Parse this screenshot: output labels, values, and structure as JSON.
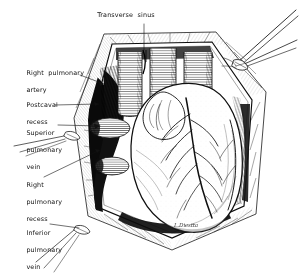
{
  "figure": {
    "medium": "pen-and-ink line drawing",
    "background_color": "#ffffff",
    "ink_color": "#111111",
    "signature": "L.Diestta"
  },
  "labels": [
    {
      "id": "transverse-sinus",
      "text": "Transverse  sinus",
      "lines": [
        "Transverse  sinus"
      ],
      "x": 126,
      "y": 14,
      "anchor": "center",
      "leader_from": [
        144,
        24
      ],
      "leader_to": [
        144,
        50
      ]
    },
    {
      "id": "right-pulmonary-artery",
      "text": "Right pulmonary artery",
      "lines": [
        "Right  pulmonary",
        "artery"
      ],
      "x": 22,
      "y": 60,
      "anchor": "left",
      "leader_from": [
        80,
        75
      ],
      "leader_to": [
        104,
        84
      ]
    },
    {
      "id": "postcaval-recess",
      "text": "Postcaval recess",
      "lines": [
        "Postcaval",
        "recess"
      ],
      "x": 22,
      "y": 92,
      "anchor": "left",
      "leader_from": [
        55,
        105
      ],
      "leader_to": [
        99,
        104
      ]
    },
    {
      "id": "superior-pulmonary-vein",
      "text": "Superior pulmonary vein",
      "lines": [
        "Superior",
        "pulmonary",
        "vein"
      ],
      "x": 22,
      "y": 120,
      "anchor": "left",
      "leader_from": [
        58,
        125
      ],
      "leader_to": [
        100,
        126
      ]
    },
    {
      "id": "right-pulmonary-recess",
      "text": "Right pulmonary recess",
      "lines": [
        "Right",
        "pulmonary",
        "recess"
      ],
      "x": 22,
      "y": 172,
      "anchor": "left",
      "leader_from": [
        44,
        177
      ],
      "leader_to": [
        100,
        150
      ]
    },
    {
      "id": "inferior-pulmonary-vein",
      "text": "Inferior pulmonary vein",
      "lines": [
        "Inferior",
        "pulmonary",
        "vein"
      ],
      "x": 22,
      "y": 220,
      "anchor": "left",
      "leader_from": [
        50,
        224
      ],
      "leader_to": [
        79,
        228
      ]
    }
  ],
  "structures": [
    {
      "id": "pericardial-opening",
      "name": "opened pericardial sac"
    },
    {
      "id": "heart-body",
      "name": "heart, anterior surface"
    },
    {
      "id": "great-vessels",
      "name": "great vessels at base of heart"
    },
    {
      "id": "pulmonary-vein-stumps",
      "name": "divided pulmonary vein stumps"
    },
    {
      "id": "coronary-vessels",
      "name": "coronary arteries and veins"
    },
    {
      "id": "retractor-sutures",
      "name": "traction sutures at upper right"
    }
  ]
}
